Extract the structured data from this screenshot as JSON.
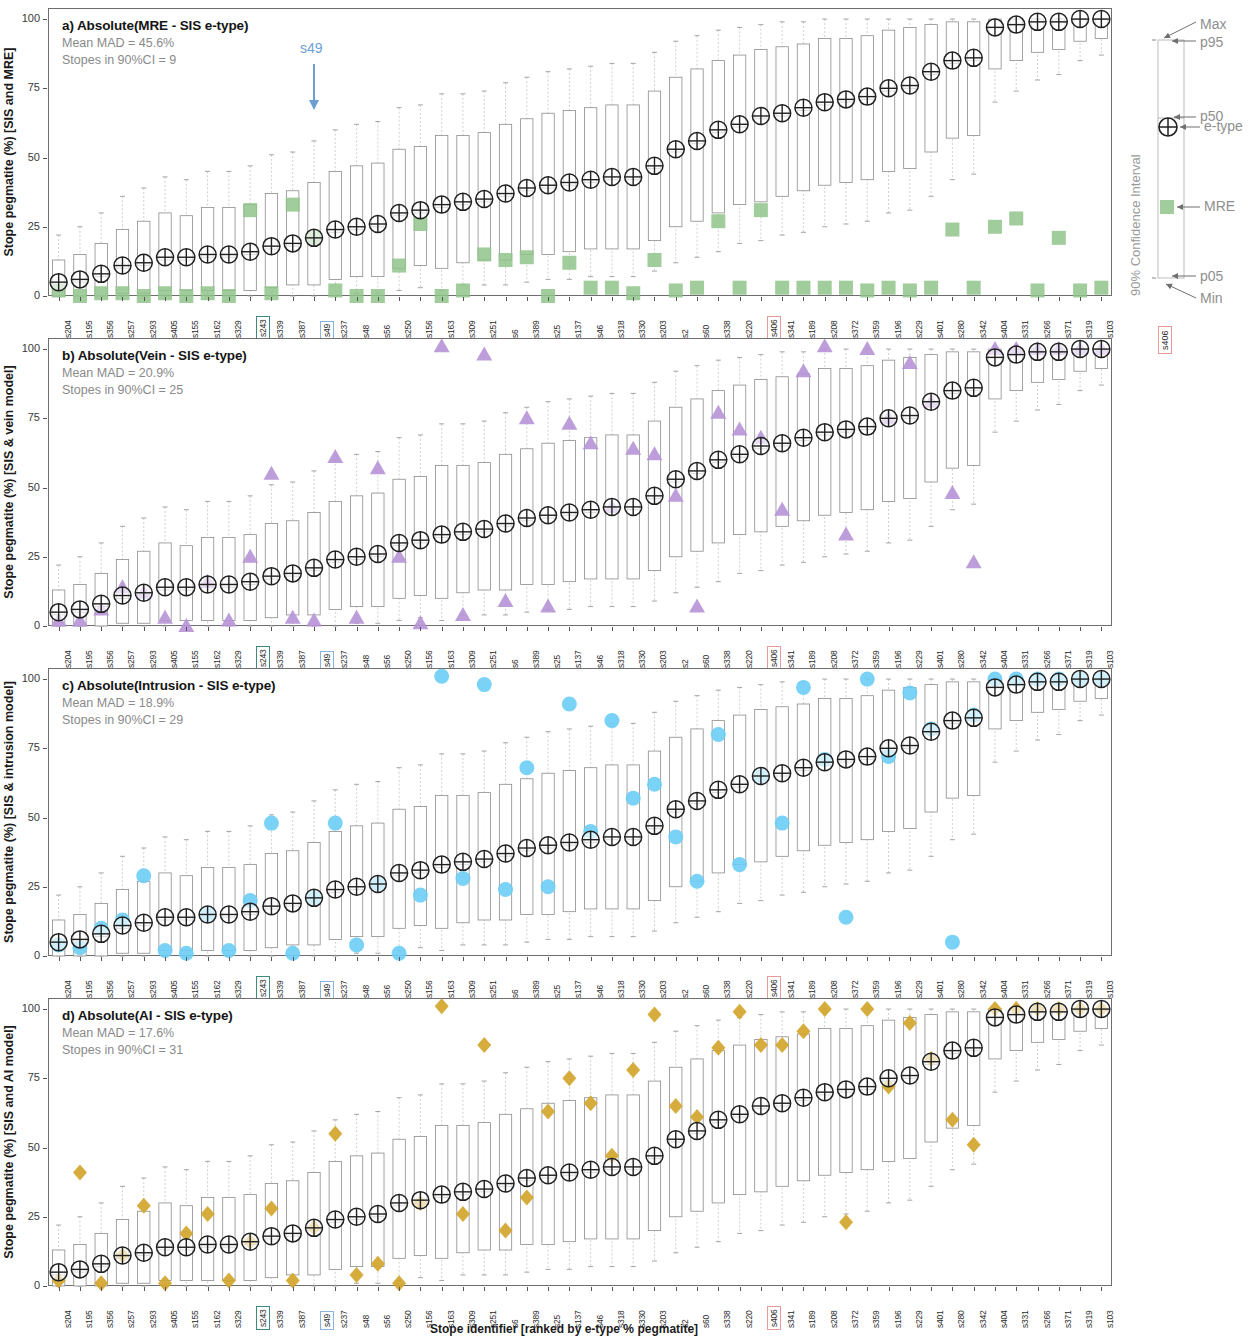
{
  "figure": {
    "x_axis_label": "Stope identifier [ranked by e-type % pegmatite]",
    "y_ticks": [
      "0",
      "25",
      "50",
      "75",
      "100"
    ],
    "annotation_s49": "s49",
    "highlight_colors": {
      "s243": "#3f8a80",
      "s49": "#8ab4e0",
      "s406": "#e89a9a"
    }
  },
  "legend": {
    "vertical_label": "90% Confidence Interval",
    "items": [
      {
        "key": "max",
        "label": "Max"
      },
      {
        "key": "p95",
        "label": "p95"
      },
      {
        "key": "p50",
        "label": "p50"
      },
      {
        "key": "etype",
        "label": "e-type"
      },
      {
        "key": "mre",
        "label": "MRE"
      },
      {
        "key": "p05",
        "label": "p05"
      },
      {
        "key": "min",
        "label": "Min"
      }
    ],
    "highlight_stope": "s406"
  },
  "panels": [
    {
      "id": "a",
      "title": "a) Absolute(MRE - SIS e-type)",
      "mean_mad": "Mean MAD = 45.6%",
      "stopes_ci": "Stopes in 90%CI = 9",
      "y_axis_label": "Stope pegmatite (%) [SIS and MRE]",
      "marker_shape": "square",
      "marker_color": "#8fc48a",
      "marker_name": "mre-marker"
    },
    {
      "id": "b",
      "title": "b) Absolute(Vein - SIS e-type)",
      "mean_mad": "Mean MAD = 20.9%",
      "stopes_ci": "Stopes in 90%CI = 25",
      "y_axis_label": "Stope pegmatite (%) [SIS & vein model]",
      "marker_shape": "triangle",
      "marker_color": "#b793d6",
      "marker_name": "vein-marker"
    },
    {
      "id": "c",
      "title": "c) Absolute(Intrusion - SIS e-type)",
      "mean_mad": "Mean MAD = 18.9%",
      "stopes_ci": "Stopes in 90%CI = 29",
      "y_axis_label": "Stope pegmatite (%) [SIS & intrusion model]",
      "marker_shape": "circle",
      "marker_color": "#6ccef5",
      "marker_name": "intrusion-marker"
    },
    {
      "id": "d",
      "title": "d) Absolute(AI - SIS e-type)",
      "mean_mad": "Mean MAD = 17.6%",
      "stopes_ci": "Stopes in 90%CI = 31",
      "y_axis_label": "Stope pegmatite (%) [SIS and AI model]",
      "marker_shape": "diamond",
      "marker_color": "#d2a62c",
      "marker_name": "ai-marker"
    }
  ],
  "chart_data": {
    "type": "box",
    "xlabel": "Stope identifier [ranked by e-type % pegmatite]",
    "ylabel": "Stope pegmatite (%)",
    "ylim": [
      0,
      104
    ],
    "yticks": [
      0,
      25,
      50,
      75,
      100
    ],
    "grid": false,
    "legend_position": "right",
    "categories": [
      "s204",
      "s195",
      "s356",
      "s257",
      "s293",
      "s405",
      "s155",
      "s162",
      "s329",
      "s243",
      "s339",
      "s387",
      "s49",
      "s237",
      "s48",
      "s56",
      "s250",
      "s156",
      "s163",
      "s309",
      "s251",
      "s6",
      "s389",
      "s25",
      "s137",
      "s46",
      "s318",
      "s330",
      "s203",
      "s2",
      "s60",
      "s338",
      "s220",
      "s406",
      "s341",
      "s189",
      "s208",
      "s372",
      "s359",
      "s196",
      "s229",
      "s401",
      "s280",
      "s342",
      "s404",
      "s331",
      "s266",
      "s371",
      "s319",
      "s103"
    ],
    "highlighted_categories": [
      "s243",
      "s49",
      "s406"
    ],
    "series": [
      {
        "name": "SIS e-type",
        "type": "point",
        "values": [
          5,
          6,
          8,
          11,
          12,
          14,
          14,
          15,
          15,
          16,
          18,
          19,
          21,
          24,
          25,
          26,
          30,
          31,
          33,
          34,
          35,
          37,
          39,
          40,
          41,
          42,
          43,
          43,
          47,
          53,
          56,
          60,
          62,
          65,
          66,
          68,
          70,
          71,
          72,
          75,
          76,
          81,
          85,
          86,
          97,
          98,
          99,
          99,
          100,
          100
        ]
      },
      {
        "name": "p05",
        "type": "box_low",
        "values": [
          0,
          0,
          0,
          1,
          1,
          2,
          2,
          2,
          2,
          2,
          3,
          4,
          4,
          6,
          7,
          7,
          10,
          11,
          10,
          12,
          13,
          13,
          15,
          15,
          16,
          17,
          17,
          17,
          20,
          25,
          27,
          30,
          33,
          34,
          36,
          38,
          40,
          41,
          42,
          45,
          46,
          52,
          57,
          58,
          82,
          85,
          88,
          89,
          92,
          93
        ]
      },
      {
        "name": "p95",
        "type": "box_high",
        "values": [
          13,
          15,
          19,
          24,
          27,
          30,
          29,
          32,
          32,
          33,
          37,
          38,
          41,
          45,
          47,
          48,
          53,
          54,
          58,
          58,
          59,
          62,
          64,
          66,
          67,
          68,
          69,
          69,
          74,
          79,
          82,
          85,
          87,
          89,
          90,
          91,
          93,
          93,
          94,
          96,
          97,
          98,
          99,
          99,
          100,
          100,
          100,
          100,
          100,
          100
        ]
      },
      {
        "name": "p50",
        "type": "median",
        "values": [
          4,
          5,
          7,
          10,
          11,
          13,
          13,
          14,
          14,
          15,
          17,
          18,
          20,
          23,
          24,
          25,
          29,
          30,
          32,
          33,
          34,
          36,
          38,
          39,
          40,
          41,
          42,
          42,
          46,
          52,
          55,
          59,
          61,
          64,
          65,
          67,
          69,
          70,
          71,
          74,
          75,
          80,
          84,
          85,
          97,
          98,
          99,
          99,
          100,
          100
        ]
      },
      {
        "name": "Min",
        "type": "whisker_low",
        "values": [
          0,
          0,
          0,
          0,
          0,
          0,
          0,
          0,
          0,
          0,
          0,
          0,
          0,
          0,
          1,
          1,
          2,
          3,
          2,
          4,
          4,
          4,
          5,
          6,
          6,
          7,
          7,
          7,
          9,
          12,
          14,
          16,
          19,
          20,
          22,
          23,
          25,
          26,
          27,
          30,
          31,
          36,
          42,
          44,
          70,
          74,
          78,
          80,
          85,
          87
        ]
      },
      {
        "name": "Max",
        "type": "whisker_high",
        "values": [
          22,
          25,
          30,
          36,
          39,
          43,
          42,
          45,
          45,
          47,
          51,
          52,
          56,
          60,
          62,
          63,
          68,
          69,
          73,
          73,
          74,
          77,
          79,
          81,
          82,
          83,
          84,
          84,
          88,
          92,
          94,
          96,
          97,
          98,
          99,
          99,
          100,
          100,
          100,
          100,
          100,
          100,
          100,
          100,
          100,
          100,
          100,
          100,
          100,
          100
        ]
      },
      {
        "name": "MRE",
        "type": "marker",
        "panel": "a",
        "values": [
          2,
          0,
          1,
          1,
          0,
          1,
          0,
          1,
          0,
          31,
          1,
          33,
          21,
          2,
          0,
          0,
          11,
          26,
          0,
          2,
          15,
          13,
          14,
          0,
          12,
          3,
          3,
          1,
          13,
          2,
          3,
          27,
          3,
          31,
          3,
          3,
          3,
          3,
          2,
          3,
          2,
          3,
          24,
          3,
          25,
          28,
          2,
          21,
          2,
          3
        ]
      },
      {
        "name": "Vein model",
        "type": "marker",
        "panel": "b",
        "values": [
          2,
          2,
          6,
          14,
          12,
          3,
          0,
          16,
          2,
          25,
          55,
          3,
          2,
          61,
          3,
          57,
          25,
          1,
          101,
          4,
          98,
          9,
          75,
          7,
          73,
          66,
          43,
          64,
          62,
          47,
          7,
          77,
          71,
          68,
          42,
          92,
          101,
          33,
          100,
          75,
          95,
          81,
          48,
          23,
          100,
          100,
          100,
          100,
          100,
          100
        ]
      },
      {
        "name": "Intrusion model",
        "type": "marker",
        "panel": "c",
        "values": [
          4,
          3,
          10,
          13,
          29,
          2,
          1,
          15,
          2,
          20,
          48,
          1,
          21,
          48,
          4,
          26,
          1,
          22,
          101,
          28,
          98,
          24,
          68,
          25,
          91,
          45,
          85,
          57,
          62,
          43,
          27,
          80,
          33,
          65,
          48,
          97,
          71,
          14,
          100,
          72,
          95,
          82,
          5,
          87,
          100,
          100,
          100,
          100,
          100,
          100
        ]
      },
      {
        "name": "AI model",
        "type": "marker",
        "panel": "d",
        "values": [
          2,
          41,
          1,
          11,
          29,
          1,
          19,
          26,
          2,
          16,
          28,
          2,
          21,
          55,
          4,
          8,
          1,
          30,
          101,
          26,
          87,
          20,
          32,
          63,
          75,
          66,
          47,
          78,
          98,
          65,
          61,
          86,
          99,
          87,
          87,
          92,
          100,
          23,
          100,
          72,
          95,
          82,
          60,
          51,
          100,
          100,
          100,
          100,
          100,
          100
        ]
      }
    ]
  }
}
